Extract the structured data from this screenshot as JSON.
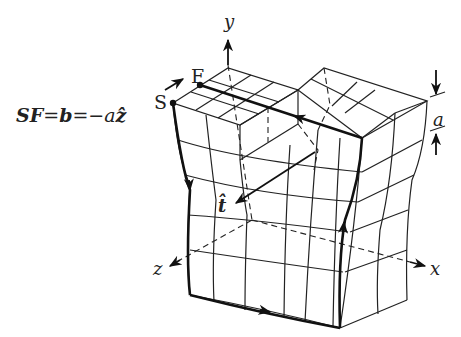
{
  "diagram": {
    "type": "screw-dislocation-burgers-circuit",
    "equation": {
      "lhs": "SF",
      "eq1": "=",
      "mid": "b",
      "eq2": "=",
      "rhs": "−a",
      "unit": "ẑ"
    },
    "points": {
      "start": "S",
      "finish": "F"
    },
    "axes": {
      "x": "x",
      "y": "y",
      "z": "z"
    },
    "line_direction": "t̂",
    "step_height": "a",
    "colors": {
      "ink": "#222222",
      "background": "#ffffff"
    }
  }
}
